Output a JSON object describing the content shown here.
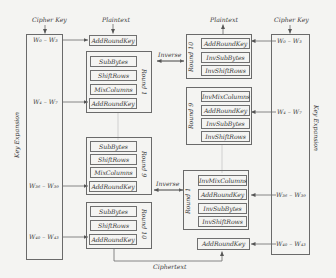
{
  "encryption": {
    "cipher_key_label": "Cipher Key",
    "plaintext_label": "Plaintext",
    "key_expansion_label": "Key Expansion",
    "words": {
      "w0_3": "W₀ – W₃",
      "w4_7": "W₄ – W₇",
      "w36_39": "W₃₆ – W₃₉",
      "w40_43": "W₄₀ – W₄₃"
    },
    "initial_add_round_key": "AddRoundKey",
    "round1": {
      "label": "Round 1",
      "ops": [
        "SubBytes",
        "ShiftRows",
        "MixColumns",
        "AddRoundKey"
      ]
    },
    "round9": {
      "label": "Round 9",
      "ops": [
        "SubBytes",
        "ShiftRows",
        "MixColumns",
        "AddRoundKey"
      ]
    },
    "round10": {
      "label": "Round 10",
      "ops": [
        "SubBytes",
        "ShiftRows",
        "AddRoundKey"
      ]
    },
    "ciphertext_label": "Ciphertext"
  },
  "decryption": {
    "cipher_key_label": "Cipher Key",
    "plaintext_label": "Plaintext",
    "key_expansion_label": "Key Expansion",
    "words": {
      "w0_3": "W₀ – W₃",
      "w4_7": "W₄ – W₇",
      "w36_39": "W₃₆ – W₃₉",
      "w40_43": "W₄₀ – W₄₃"
    },
    "round10": {
      "label": "Round 10",
      "ops": [
        "AddRoundKey",
        "InvSubBytes",
        "InvShiftRows"
      ]
    },
    "round9": {
      "label": "Round 9",
      "ops": [
        "InvMixColumns",
        "AddRoundKey",
        "InvSubBytes",
        "InvShiftRows"
      ]
    },
    "round1": {
      "label": "Round 1",
      "ops": [
        "InvMixColumns",
        "AddRoundKey",
        "InvSubBytes",
        "InvShiftRows"
      ]
    },
    "final_add_round_key": "AddRoundKey"
  },
  "inverse_labels": [
    "Inverse",
    "Inverse"
  ],
  "colors": {
    "background": "#f4f4f2",
    "line": "#6a6a6a",
    "text": "#3a3a3a"
  }
}
